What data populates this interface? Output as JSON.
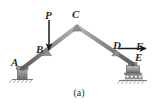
{
  "figure": {
    "caption": "(a)",
    "background_color": "#ffffff",
    "line_color": "#6e6e6e",
    "label_color": "#2b2b2b",
    "arrow_color": "#1a1a1a",
    "joints": [
      {
        "id": "A",
        "label": "A",
        "x": 22,
        "y": 70,
        "type": "pin-support"
      },
      {
        "id": "B",
        "label": "B",
        "x": 47,
        "y": 53,
        "type": "joint"
      },
      {
        "id": "C",
        "label": "C",
        "x": 77,
        "y": 26,
        "type": "joint"
      },
      {
        "id": "D",
        "label": "D",
        "x": 116,
        "y": 53,
        "type": "joint"
      },
      {
        "id": "E",
        "label": "E",
        "x": 132,
        "y": 66,
        "type": "roller-support"
      }
    ],
    "members": [
      {
        "from": "A",
        "to": "C",
        "through": "B"
      },
      {
        "from": "C",
        "to": "E",
        "through": "D"
      },
      {
        "from": "B",
        "to": "D"
      }
    ],
    "forces": [
      {
        "label": "P",
        "at": "B",
        "direction": "down",
        "tail_x": 49,
        "tail_y": 20,
        "head_x": 49,
        "head_y": 51
      },
      {
        "label": "F",
        "at": "D",
        "direction": "right",
        "tail_x": 118,
        "tail_y": 49,
        "head_x": 145,
        "head_y": 49
      }
    ],
    "supports": {
      "left": {
        "at": "A",
        "kind": "pin-support"
      },
      "right": {
        "at": "E",
        "kind": "roller-support",
        "roller_count": 4
      }
    }
  }
}
